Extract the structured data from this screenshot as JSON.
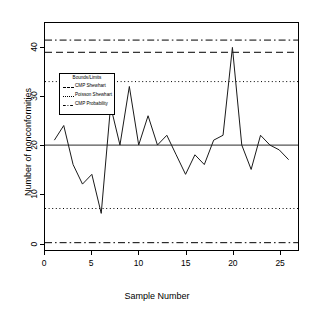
{
  "chart_data": {
    "type": "line",
    "title": "",
    "xlabel": "Sample Number",
    "ylabel": "Number of nonconformities",
    "xlim": [
      0,
      27
    ],
    "ylim": [
      -1.5,
      45
    ],
    "grid": false,
    "xticks": [
      0,
      5,
      10,
      15,
      20,
      25
    ],
    "xtick_labels": [
      "0",
      "5",
      "10",
      "15",
      "20",
      "25"
    ],
    "yticks": [
      0,
      10,
      20,
      30,
      40
    ],
    "ytick_labels": [
      "0",
      "10",
      "20",
      "30",
      "40"
    ],
    "series": [
      {
        "name": "Number of nonconformities",
        "x": [
          1,
          2,
          3,
          4,
          5,
          6,
          7,
          8,
          9,
          10,
          11,
          12,
          13,
          14,
          15,
          16,
          17,
          18,
          19,
          20,
          21,
          22,
          23,
          24,
          25,
          26
        ],
        "values": [
          21,
          24,
          16,
          12,
          14,
          6,
          28,
          20,
          32,
          20,
          26,
          20,
          22,
          18,
          14,
          18,
          16,
          21,
          22,
          40,
          20,
          15,
          22,
          20,
          19,
          17
        ]
      }
    ],
    "center_line": {
      "name": "Center Line",
      "value": 20,
      "style": "solid",
      "color": "#555555"
    },
    "limit_lines": [
      {
        "name": "CMP Probability upper",
        "value": 41.5,
        "style": "dashdot",
        "color": "#000000"
      },
      {
        "name": "CMP Shewhart upper",
        "value": 39.0,
        "style": "dashed",
        "color": "#000000"
      },
      {
        "name": "Poisson Shewhart upper",
        "value": 33.0,
        "style": "dotted",
        "color": "#000000"
      },
      {
        "name": "Poisson Shewhart lower",
        "value": 7.0,
        "style": "dotted",
        "color": "#000000"
      },
      {
        "name": "CMP Probability lower",
        "value": 0.0,
        "style": "dashdot",
        "color": "#000000"
      }
    ],
    "legend": {
      "position": "upper-left-inside",
      "title": "Bounds/Limits",
      "entries": [
        {
          "label": "CMP Shewhart",
          "style": "dashed"
        },
        {
          "label": "Poisson Shewhart",
          "style": "dotted"
        },
        {
          "label": "CMP Probability",
          "style": "dashdot"
        }
      ]
    }
  }
}
